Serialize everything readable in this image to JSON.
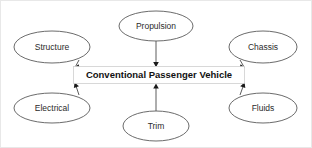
{
  "diagram": {
    "center": {
      "label": "Conventional Passenger Vehicle",
      "shape": "rectangle",
      "border_color": "#cfcfcf",
      "fill_color": "#ffffff",
      "text_color": "#111111"
    },
    "nodes": [
      {
        "id": "structure",
        "label": "Structure",
        "shape": "ellipse",
        "position": "top-left",
        "cx": 51,
        "cy": 46,
        "rx": 38,
        "ry": 16
      },
      {
        "id": "propulsion",
        "label": "Propulsion",
        "shape": "ellipse",
        "position": "top-center",
        "cx": 155,
        "cy": 25,
        "rx": 37,
        "ry": 15
      },
      {
        "id": "chassis",
        "label": "Chassis",
        "shape": "ellipse",
        "position": "top-right",
        "cx": 262,
        "cy": 46,
        "rx": 34,
        "ry": 16
      },
      {
        "id": "electrical",
        "label": "Electrical",
        "shape": "ellipse",
        "position": "bottom-left",
        "cx": 51,
        "cy": 107,
        "rx": 38,
        "ry": 15
      },
      {
        "id": "trim",
        "label": "Trim",
        "shape": "ellipse",
        "position": "bottom-center",
        "cx": 155,
        "cy": 125,
        "rx": 33,
        "ry": 15
      },
      {
        "id": "fluids",
        "label": "Fluids",
        "shape": "ellipse",
        "position": "bottom-right",
        "cx": 262,
        "cy": 107,
        "rx": 34,
        "ry": 15
      }
    ],
    "edges": [
      {
        "from": "structure",
        "to": "center",
        "direction": "to-center",
        "arrowhead": "filled-triangle"
      },
      {
        "from": "propulsion",
        "to": "center",
        "direction": "to-center",
        "arrowhead": "filled-triangle"
      },
      {
        "from": "chassis",
        "to": "center",
        "direction": "to-center",
        "arrowhead": "filled-triangle"
      },
      {
        "from": "electrical",
        "to": "center",
        "direction": "to-center",
        "arrowhead": "filled-triangle"
      },
      {
        "from": "trim",
        "to": "center",
        "direction": "to-center",
        "arrowhead": "filled-triangle"
      },
      {
        "from": "fluids",
        "to": "center",
        "direction": "to-center",
        "arrowhead": "filled-triangle"
      }
    ],
    "colors": {
      "background": "#ffffff",
      "node_stroke": "#5a5a5a",
      "edge_stroke": "#4a4a4a",
      "arrow_fill": "#1a1a1a",
      "frame_border": "#e8e8e8"
    }
  }
}
